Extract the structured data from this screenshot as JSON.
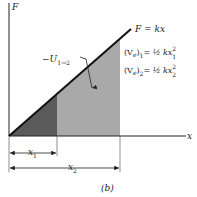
{
  "figure": {
    "caption": "(b)",
    "axis_y_label": "F",
    "axis_x_label": "x",
    "line_label": "F = kx",
    "work_label": {
      "prefix": "−U",
      "subscript": "1→2"
    },
    "equation1": {
      "lhs": "(V",
      "lhs_sub": "e",
      "lhs_close": ")",
      "index": "1",
      "rhs": "= ½ kx",
      "sup": "2",
      "sub": "1"
    },
    "equation2": {
      "lhs": "(V",
      "lhs_sub": "e",
      "lhs_close": ")",
      "index": "2",
      "rhs": "= ½ kx",
      "sup": "2",
      "sub": "2"
    },
    "dimension1": {
      "label": "x",
      "sub": "1"
    },
    "dimension2": {
      "label": "x",
      "sub": "2"
    },
    "colors": {
      "dark_region": "#5a5a5a",
      "light_region": "#a9a9a9",
      "line": "#111111"
    }
  }
}
